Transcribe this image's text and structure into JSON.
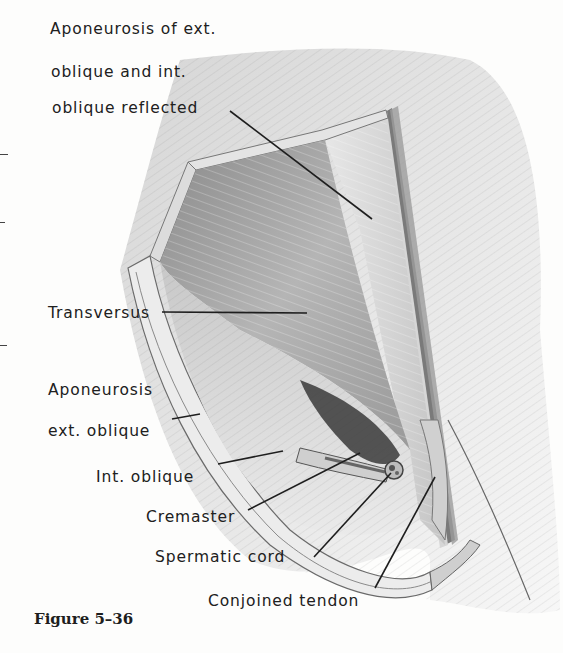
{
  "figure": {
    "caption": "Figure 5–36"
  },
  "labels": {
    "aponeurosis_ext_int_line1": "Aponeurosis of ext.",
    "aponeurosis_ext_int_line2": "oblique and int.",
    "aponeurosis_ext_int_line3": "oblique reflected",
    "transversus": "Transversus",
    "aponeurosis_ext_oblique_line1": "Aponeurosis",
    "aponeurosis_ext_oblique_line2": "ext. oblique",
    "int_oblique": "Int. oblique",
    "cremaster": "Cremaster",
    "spermatic_cord": "Spermatic cord",
    "conjoined_tendon": "Conjoined tendon"
  },
  "colors": {
    "ink": "#202020",
    "paper": "#fdfdfc",
    "tissue_light": "#d8d8d8",
    "tissue_mid": "#a8a8a8",
    "tissue_dark": "#4a4a4a"
  }
}
